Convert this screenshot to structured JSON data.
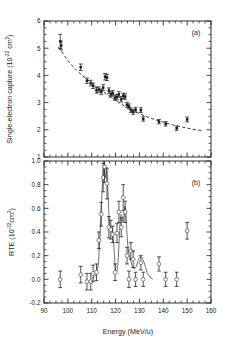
{
  "figure": {
    "width": 231,
    "height": 343,
    "background": "#ffffff",
    "ink_color": "#1a1a1a",
    "curve_color": "#555555"
  },
  "axes": {
    "x": {
      "label_main": "Energy (MeV/u)",
      "min": 90,
      "max": 160,
      "major_ticks": [
        90,
        100,
        110,
        120,
        130,
        140,
        150,
        160
      ],
      "major_tick_labels": [
        "90",
        "100",
        "110",
        "120",
        "130",
        "140",
        "150",
        "160"
      ],
      "minor_step": 2.5
    }
  },
  "panel_a": {
    "label": "(a)",
    "ylabel_text": "Single-electron capture (10",
    "ylabel_exp": "-22",
    "ylabel_tail": " cm",
    "ylabel_exp2": "2",
    "ylabel_close": ")",
    "ylabel_full": "Single-electron capture (10^-22 cm^2)",
    "ymin": 1,
    "ymax": 6,
    "major_ticks": [
      1,
      2,
      3,
      4,
      5,
      6
    ],
    "major_tick_labels": [
      "1",
      "2",
      "3",
      "4",
      "5",
      "6"
    ],
    "minor_step": 0.25,
    "marker": "filled-square"
  },
  "panel_b": {
    "label": "(b)",
    "ylabel_text": "RTE (10",
    "ylabel_exp": "-22",
    "ylabel_tail": "cm",
    "ylabel_exp2": "2",
    "ylabel_close": ")",
    "ylabel_full": "RTE (10^-22 cm^2)",
    "ymin": -0.2,
    "ymax": 1.0,
    "major_ticks": [
      -0.2,
      0.0,
      0.2,
      0.4,
      0.6,
      0.8,
      1.0
    ],
    "major_tick_labels": [
      "-0.2",
      "0.0",
      "0.2",
      "0.4",
      "0.6",
      "0.8",
      "1.0"
    ],
    "minor_step": 0.05,
    "marker": "open-circle"
  },
  "chart_data": [
    {
      "type": "scatter",
      "panel": "a",
      "title": "Single-electron capture cross section vs energy",
      "xlabel": "Energy (MeV/u)",
      "ylabel": "Single-electron capture (10^-22 cm^2)",
      "xlim": [
        90,
        160
      ],
      "ylim": [
        1,
        6
      ],
      "grid": false,
      "legend": "none",
      "series": [
        {
          "name": "measured capture cross section",
          "marker": "filled-square",
          "errorbars": "symmetric-y",
          "x": [
            96.8,
            97.2,
            105.4,
            108.0,
            109.6,
            110.6,
            112.0,
            113.0,
            114.0,
            114.8,
            115.6,
            116.4,
            117.2,
            118.0,
            118.8,
            119.8,
            120.6,
            121.4,
            122.4,
            123.2,
            124.0,
            124.8,
            125.6,
            126.4,
            127.4,
            128.4,
            130.6,
            131.6,
            138.2,
            141.0,
            145.6,
            150.0
          ],
          "y": [
            5.25,
            5.1,
            4.3,
            3.8,
            3.72,
            3.62,
            3.45,
            3.48,
            3.4,
            3.55,
            3.95,
            3.92,
            3.44,
            3.3,
            3.34,
            3.18,
            3.2,
            3.3,
            3.12,
            3.25,
            3.22,
            2.92,
            2.86,
            2.72,
            2.66,
            2.74,
            2.72,
            2.4,
            2.3,
            2.22,
            2.06,
            2.38
          ],
          "yerr": [
            0.26,
            0.16,
            0.12,
            0.1,
            0.1,
            0.1,
            0.1,
            0.1,
            0.1,
            0.11,
            0.12,
            0.11,
            0.1,
            0.1,
            0.1,
            0.1,
            0.1,
            0.1,
            0.1,
            0.1,
            0.1,
            0.09,
            0.09,
            0.09,
            0.09,
            0.09,
            0.09,
            0.08,
            0.08,
            0.08,
            0.08,
            0.09
          ]
        },
        {
          "name": "non-resonant capture fit",
          "style": "dashed",
          "x": [
            96,
            100,
            104,
            108,
            112,
            116,
            120,
            124,
            128,
            132,
            136,
            140,
            144,
            148,
            152,
            156
          ],
          "y": [
            5.05,
            4.55,
            4.16,
            3.86,
            3.58,
            3.32,
            3.08,
            2.86,
            2.68,
            2.52,
            2.39,
            2.28,
            2.18,
            2.1,
            2.03,
            1.97
          ]
        }
      ]
    },
    {
      "type": "scatter",
      "panel": "b",
      "title": "Resonant transfer and excitation (RTE) vs energy",
      "xlabel": "Energy (MeV/u)",
      "ylabel": "RTE (10^-22 cm^2)",
      "xlim": [
        90,
        160
      ],
      "ylim": [
        -0.2,
        1.0
      ],
      "grid": false,
      "legend": "none",
      "series": [
        {
          "name": "RTE cross section (difference)",
          "marker": "open-circle",
          "errorbars": "symmetric-y",
          "x": [
            96.8,
            105.4,
            108.0,
            109.6,
            110.6,
            112.0,
            113.0,
            114.0,
            114.8,
            115.4,
            116.4,
            117.2,
            118.0,
            118.8,
            119.8,
            120.6,
            121.4,
            122.4,
            123.2,
            124.0,
            124.8,
            125.6,
            126.4,
            127.4,
            128.4,
            130.6,
            131.6,
            138.2,
            141.0,
            145.6,
            150.0
          ],
          "y": [
            0.0,
            0.04,
            -0.02,
            -0.02,
            0.05,
            0.06,
            0.33,
            0.55,
            0.86,
            0.95,
            0.81,
            0.44,
            0.42,
            0.38,
            0.06,
            0.39,
            0.57,
            0.44,
            0.69,
            0.57,
            0.2,
            0.0,
            0.24,
            0.17,
            0.0,
            0.14,
            0.0,
            0.13,
            0.0,
            0.0,
            0.41
          ],
          "yerr": [
            0.07,
            0.07,
            0.07,
            0.07,
            0.07,
            0.07,
            0.07,
            0.1,
            0.12,
            0.13,
            0.13,
            0.09,
            0.08,
            0.07,
            0.07,
            0.08,
            0.09,
            0.08,
            0.11,
            0.09,
            0.07,
            0.07,
            0.07,
            0.07,
            0.06,
            0.06,
            0.06,
            0.06,
            0.06,
            0.06,
            0.07
          ]
        },
        {
          "name": "RTE theory",
          "style": "solid",
          "x": [
            110.0,
            111.0,
            112.0,
            112.8,
            113.4,
            114.0,
            114.6,
            115.0,
            115.4,
            115.8,
            116.2,
            116.8,
            117.4,
            118.0,
            118.6,
            119.2,
            119.8,
            120.4,
            121.0,
            121.6,
            122.2,
            122.8,
            123.2,
            123.6,
            124.0,
            124.4,
            124.8,
            125.4,
            126.0,
            126.6,
            127.2,
            127.8,
            128.4,
            129.0,
            129.6,
            130.2,
            130.8,
            131.4,
            132.0,
            132.6,
            133.2,
            134.0,
            134.8,
            135.6
          ],
          "y": [
            0.01,
            0.02,
            0.05,
            0.14,
            0.34,
            0.6,
            0.84,
            0.96,
            0.9,
            0.86,
            0.93,
            0.74,
            0.48,
            0.42,
            0.4,
            0.3,
            0.12,
            0.06,
            0.14,
            0.36,
            0.54,
            0.52,
            0.48,
            0.56,
            0.62,
            0.54,
            0.38,
            0.24,
            0.18,
            0.14,
            0.1,
            0.09,
            0.1,
            0.13,
            0.17,
            0.19,
            0.19,
            0.17,
            0.14,
            0.1,
            0.06,
            0.03,
            0.01,
            0.0
          ]
        }
      ]
    }
  ]
}
